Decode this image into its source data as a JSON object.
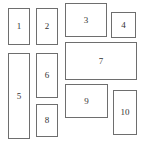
{
  "diagram": {
    "type": "layout-blocks",
    "border_color": "#6e6e6e",
    "boxes": [
      {
        "label": "1",
        "x": 8,
        "y": 8,
        "w": 22,
        "h": 37
      },
      {
        "label": "2",
        "x": 36,
        "y": 8,
        "w": 22,
        "h": 37
      },
      {
        "label": "3",
        "x": 65,
        "y": 3,
        "w": 42,
        "h": 34
      },
      {
        "label": "4",
        "x": 111,
        "y": 12,
        "w": 25,
        "h": 26
      },
      {
        "label": "5",
        "x": 8,
        "y": 53,
        "w": 22,
        "h": 86
      },
      {
        "label": "6",
        "x": 36,
        "y": 53,
        "w": 22,
        "h": 45
      },
      {
        "label": "7",
        "x": 65,
        "y": 42,
        "w": 72,
        "h": 38
      },
      {
        "label": "8",
        "x": 36,
        "y": 104,
        "w": 22,
        "h": 33
      },
      {
        "label": "9",
        "x": 65,
        "y": 84,
        "w": 43,
        "h": 34
      },
      {
        "label": "10",
        "x": 113,
        "y": 90,
        "w": 24,
        "h": 45
      }
    ]
  }
}
